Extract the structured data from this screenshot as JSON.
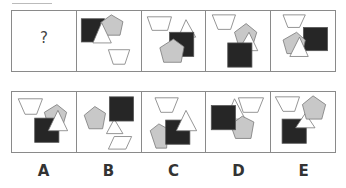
{
  "puzzle": {
    "question_cell": {
      "text": "?"
    },
    "colors": {
      "black": "#262626",
      "gray": "#c8c8c8",
      "white": "#ffffff",
      "stroke": "#777777"
    },
    "sequence": [
      {
        "index": 1,
        "shapes": [
          "black-square",
          "gray-pentagon",
          "white-triangle",
          "white-trapezoid"
        ]
      },
      {
        "index": 2,
        "shapes": [
          "white-trapezoid",
          "white-triangle",
          "black-square",
          "gray-pentagon"
        ]
      },
      {
        "index": 3,
        "shapes": [
          "white-trapezoid",
          "gray-pentagon",
          "white-triangle",
          "black-square"
        ]
      },
      {
        "index": 4,
        "shapes": [
          "white-trapezoid",
          "black-square",
          "gray-pentagon",
          "white-triangle"
        ]
      }
    ],
    "options": [
      {
        "label": "A"
      },
      {
        "label": "B"
      },
      {
        "label": "C"
      },
      {
        "label": "D"
      },
      {
        "label": "E"
      }
    ]
  }
}
